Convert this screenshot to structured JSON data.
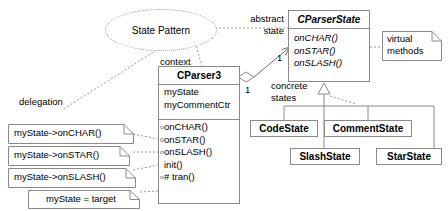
{
  "diagram": {
    "title_bubble": "State Pattern",
    "labels": {
      "abstract_state": "abstract\nstate",
      "context": "context",
      "delegation": "delegation",
      "concrete_states": "concrete\nstates",
      "virtual_methods": "virtual\nmethods"
    },
    "multiplicities": {
      "state_end": "1",
      "context_end": "1"
    },
    "classes": {
      "context_class": {
        "name": "CParser3",
        "abstract": false,
        "attributes": [
          "myState",
          "myCommentCtr"
        ],
        "operations": [
          {
            "label": "onCHAR()",
            "marker": true
          },
          {
            "label": "onSTAR()",
            "marker": true
          },
          {
            "label": "onSLASH()",
            "marker": true
          },
          {
            "label": "init()",
            "marker": false
          },
          {
            "label": "# tran()",
            "marker": true
          }
        ]
      },
      "abstract_state_class": {
        "name": "CParserState",
        "abstract": true,
        "operations": [
          {
            "label": "onCHAR()"
          },
          {
            "label": "onSTAR()"
          },
          {
            "label": "onSLASH()"
          }
        ]
      },
      "concrete": [
        {
          "name": "CodeState"
        },
        {
          "name": "CommentState"
        },
        {
          "name": "SlashState"
        },
        {
          "name": "StarState"
        }
      ]
    },
    "notes": [
      {
        "text": "myState->onCHAR()"
      },
      {
        "text": "myState->onSTAR()"
      },
      {
        "text": "myState->onSLASH()"
      },
      {
        "text": "myState = target"
      },
      {
        "text": "virtual\nmethods"
      }
    ],
    "colors": {
      "stroke": "#8a8a8a",
      "text": "#000000",
      "background": "#ffffff",
      "dotted": "#9a9a9a"
    }
  }
}
